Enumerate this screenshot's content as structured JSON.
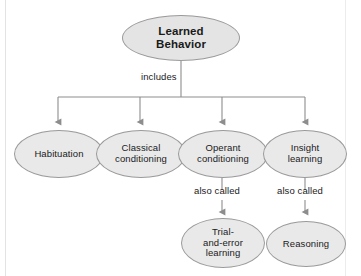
{
  "diagram": {
    "type": "flowchart-tree",
    "title": "Learned Behavior",
    "root": {
      "id": "learned-behavior",
      "label": "Learned\nBehavior",
      "bold": true
    },
    "root_edge_label": "includes",
    "children": [
      {
        "id": "habituation",
        "label": "Habituation"
      },
      {
        "id": "classical-conditioning",
        "label": "Classical\nconditioning"
      },
      {
        "id": "operant-conditioning",
        "label": "Operant\nconditioning"
      },
      {
        "id": "insight-learning",
        "label": "Insight\nlearning"
      }
    ],
    "sub_edges": [
      {
        "from": "operant-conditioning",
        "label": "also called",
        "to": "trial-and-error-learning"
      },
      {
        "from": "insight-learning",
        "label": "also called",
        "to": "reasoning"
      }
    ],
    "grandchildren": [
      {
        "id": "trial-and-error-learning",
        "label": "Trial-\nand-error\nlearning"
      },
      {
        "id": "reasoning",
        "label": "Reasoning"
      }
    ],
    "colors": {
      "node_fill": "#e9e9e9",
      "node_stroke": "#9a9a9a",
      "connector": "#8d8d8d",
      "text": "#1a1a1a",
      "background": "#ffffff"
    }
  }
}
